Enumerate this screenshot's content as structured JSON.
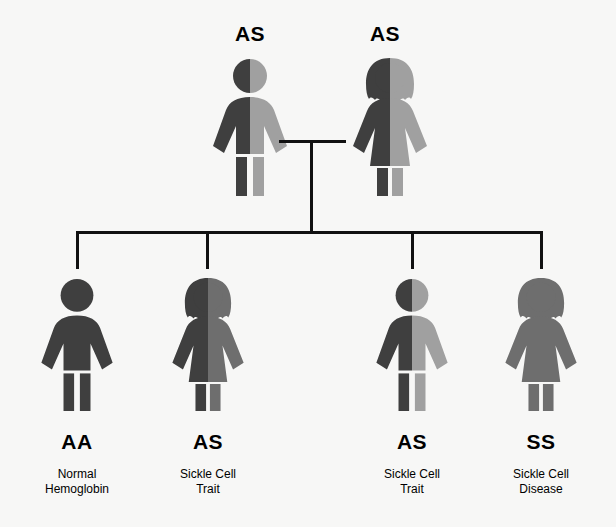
{
  "colors": {
    "background": "#f7f7f6",
    "dark": "#3f3f3f",
    "medium": "#6e6e6e",
    "light": "#a0a0a0",
    "line": "#111111",
    "text": "#000000"
  },
  "parents": [
    {
      "id": "father",
      "sex": "male",
      "genotype": "AS",
      "left_allele_color": "dark",
      "right_allele_color": "light"
    },
    {
      "id": "mother",
      "sex": "female",
      "genotype": "AS",
      "left_allele_color": "dark",
      "right_allele_color": "light"
    }
  ],
  "children": [
    {
      "id": "child-1",
      "sex": "male",
      "genotype": "AA",
      "phenotype_line1": "Normal",
      "phenotype_line2": "Hemoglobin",
      "left_allele_color": "dark",
      "right_allele_color": "dark"
    },
    {
      "id": "child-2",
      "sex": "female",
      "genotype": "AS",
      "phenotype_line1": "Sickle Cell",
      "phenotype_line2": "Trait",
      "left_allele_color": "dark",
      "right_allele_color": "medium"
    },
    {
      "id": "child-3",
      "sex": "male",
      "genotype": "AS",
      "phenotype_line1": "Sickle Cell",
      "phenotype_line2": "Trait",
      "left_allele_color": "dark",
      "right_allele_color": "light"
    },
    {
      "id": "child-4",
      "sex": "female",
      "genotype": "SS",
      "phenotype_line1": "Sickle Cell",
      "phenotype_line2": "Disease",
      "left_allele_color": "medium",
      "right_allele_color": "medium"
    }
  ]
}
